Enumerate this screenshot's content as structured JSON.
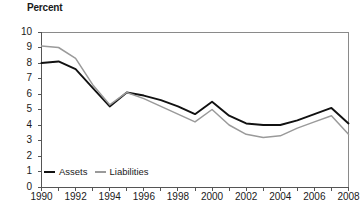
{
  "chart_data": {
    "type": "line",
    "title": "",
    "ylabel": "Percent",
    "xlabel": "",
    "ylim": [
      0,
      10
    ],
    "xlim": [
      1990,
      2008
    ],
    "grid": false,
    "legend_position": "bottom-left",
    "ytick_labels": [
      "10",
      "9",
      "8",
      "7",
      "6",
      "5",
      "4",
      "3",
      "2",
      "1",
      "0"
    ],
    "ytick_values": [
      10,
      9,
      8,
      7,
      6,
      5,
      4,
      3,
      2,
      1,
      0
    ],
    "xtick_labels": [
      "1990",
      "1992",
      "1994",
      "1996",
      "1998",
      "2000",
      "2002",
      "2004",
      "2006",
      "2008"
    ],
    "xtick_values": [
      1990,
      1992,
      1994,
      1996,
      1998,
      2000,
      2002,
      2004,
      2006,
      2008
    ],
    "x": [
      1990,
      1991,
      1992,
      1993,
      1994,
      1995,
      1996,
      1997,
      1998,
      1999,
      2000,
      2001,
      2002,
      2003,
      2004,
      2005,
      2006,
      2007,
      2008
    ],
    "series": [
      {
        "name": "Assets",
        "color": "#111111",
        "values": [
          8.0,
          8.1,
          7.6,
          6.4,
          5.2,
          6.1,
          5.9,
          5.6,
          5.2,
          4.7,
          5.5,
          4.6,
          4.1,
          4.0,
          4.0,
          4.3,
          4.7,
          5.1,
          4.1
        ]
      },
      {
        "name": "Liabilities",
        "color": "#9a9a9a",
        "values": [
          9.1,
          9.0,
          8.3,
          6.6,
          5.3,
          6.1,
          5.7,
          5.2,
          4.7,
          4.2,
          5.0,
          4.0,
          3.4,
          3.2,
          3.3,
          3.8,
          4.2,
          4.6,
          3.4
        ]
      }
    ]
  },
  "legend": {
    "items": [
      {
        "label": "Assets"
      },
      {
        "label": "Liabilities"
      }
    ]
  },
  "axis": {
    "y_title": "Percent"
  }
}
